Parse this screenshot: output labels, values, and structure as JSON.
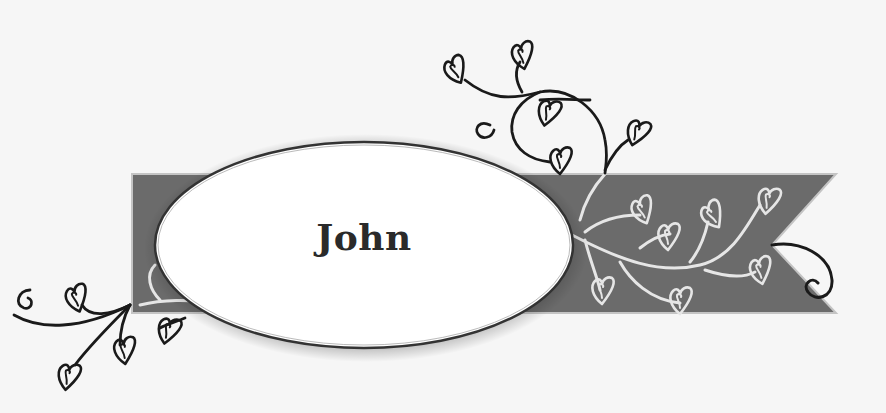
{
  "label": {
    "name": "John"
  },
  "colors": {
    "background": "#f6f6f6",
    "banner_fill": "#6b6b6b",
    "banner_border": "#bdbdbd",
    "vine_light": "#e8e8e8",
    "vine_dark": "#1a1a1a",
    "oval_fill": "#ffffff",
    "oval_stroke": "#3a3a3a"
  },
  "decor": {
    "banner": "ribbon-banner-with-notched-right-end",
    "oval": "white-oval-name-plate",
    "vines": [
      "top-heart-vine",
      "bottom-left-heart-vine",
      "banner-white-vine",
      "right-curl"
    ]
  }
}
